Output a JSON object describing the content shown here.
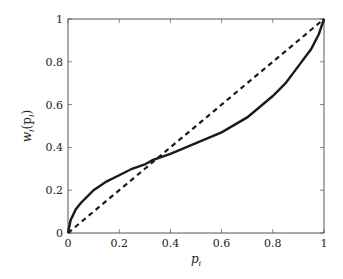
{
  "chart_data": {
    "type": "line",
    "title": "",
    "xlabel": "p_i",
    "ylabel": "w_i(p_i)",
    "xlim": [
      0,
      1
    ],
    "ylim": [
      0,
      1
    ],
    "grid": false,
    "legend": null,
    "x_ticks": [
      "0",
      "0.2",
      "0.4",
      "0.6",
      "0.8",
      "1"
    ],
    "y_ticks": [
      "0",
      "0.2",
      "0.4",
      "0.6",
      "0.8",
      "1"
    ],
    "series": [
      {
        "name": "weighting function",
        "style": "solid",
        "color": "#1a1a1a",
        "x": [
          0,
          0.01,
          0.03,
          0.05,
          0.1,
          0.15,
          0.2,
          0.25,
          0.3,
          0.33,
          0.4,
          0.5,
          0.6,
          0.7,
          0.8,
          0.85,
          0.9,
          0.95,
          0.98,
          1.0
        ],
        "y": [
          0,
          0.06,
          0.11,
          0.14,
          0.2,
          0.24,
          0.27,
          0.3,
          0.32,
          0.34,
          0.37,
          0.42,
          0.47,
          0.54,
          0.64,
          0.7,
          0.78,
          0.86,
          0.93,
          1.0
        ]
      },
      {
        "name": "identity",
        "style": "dashed",
        "color": "#1a1a1a",
        "x": [
          0,
          1
        ],
        "y": [
          0,
          1
        ]
      }
    ]
  },
  "labels": {
    "x_axis": "p",
    "x_axis_sub": "i",
    "y_axis_w": "w",
    "y_axis_sub": "i",
    "y_axis_arg": "(p",
    "y_axis_arg_sub": "i",
    "y_axis_close": ")"
  }
}
